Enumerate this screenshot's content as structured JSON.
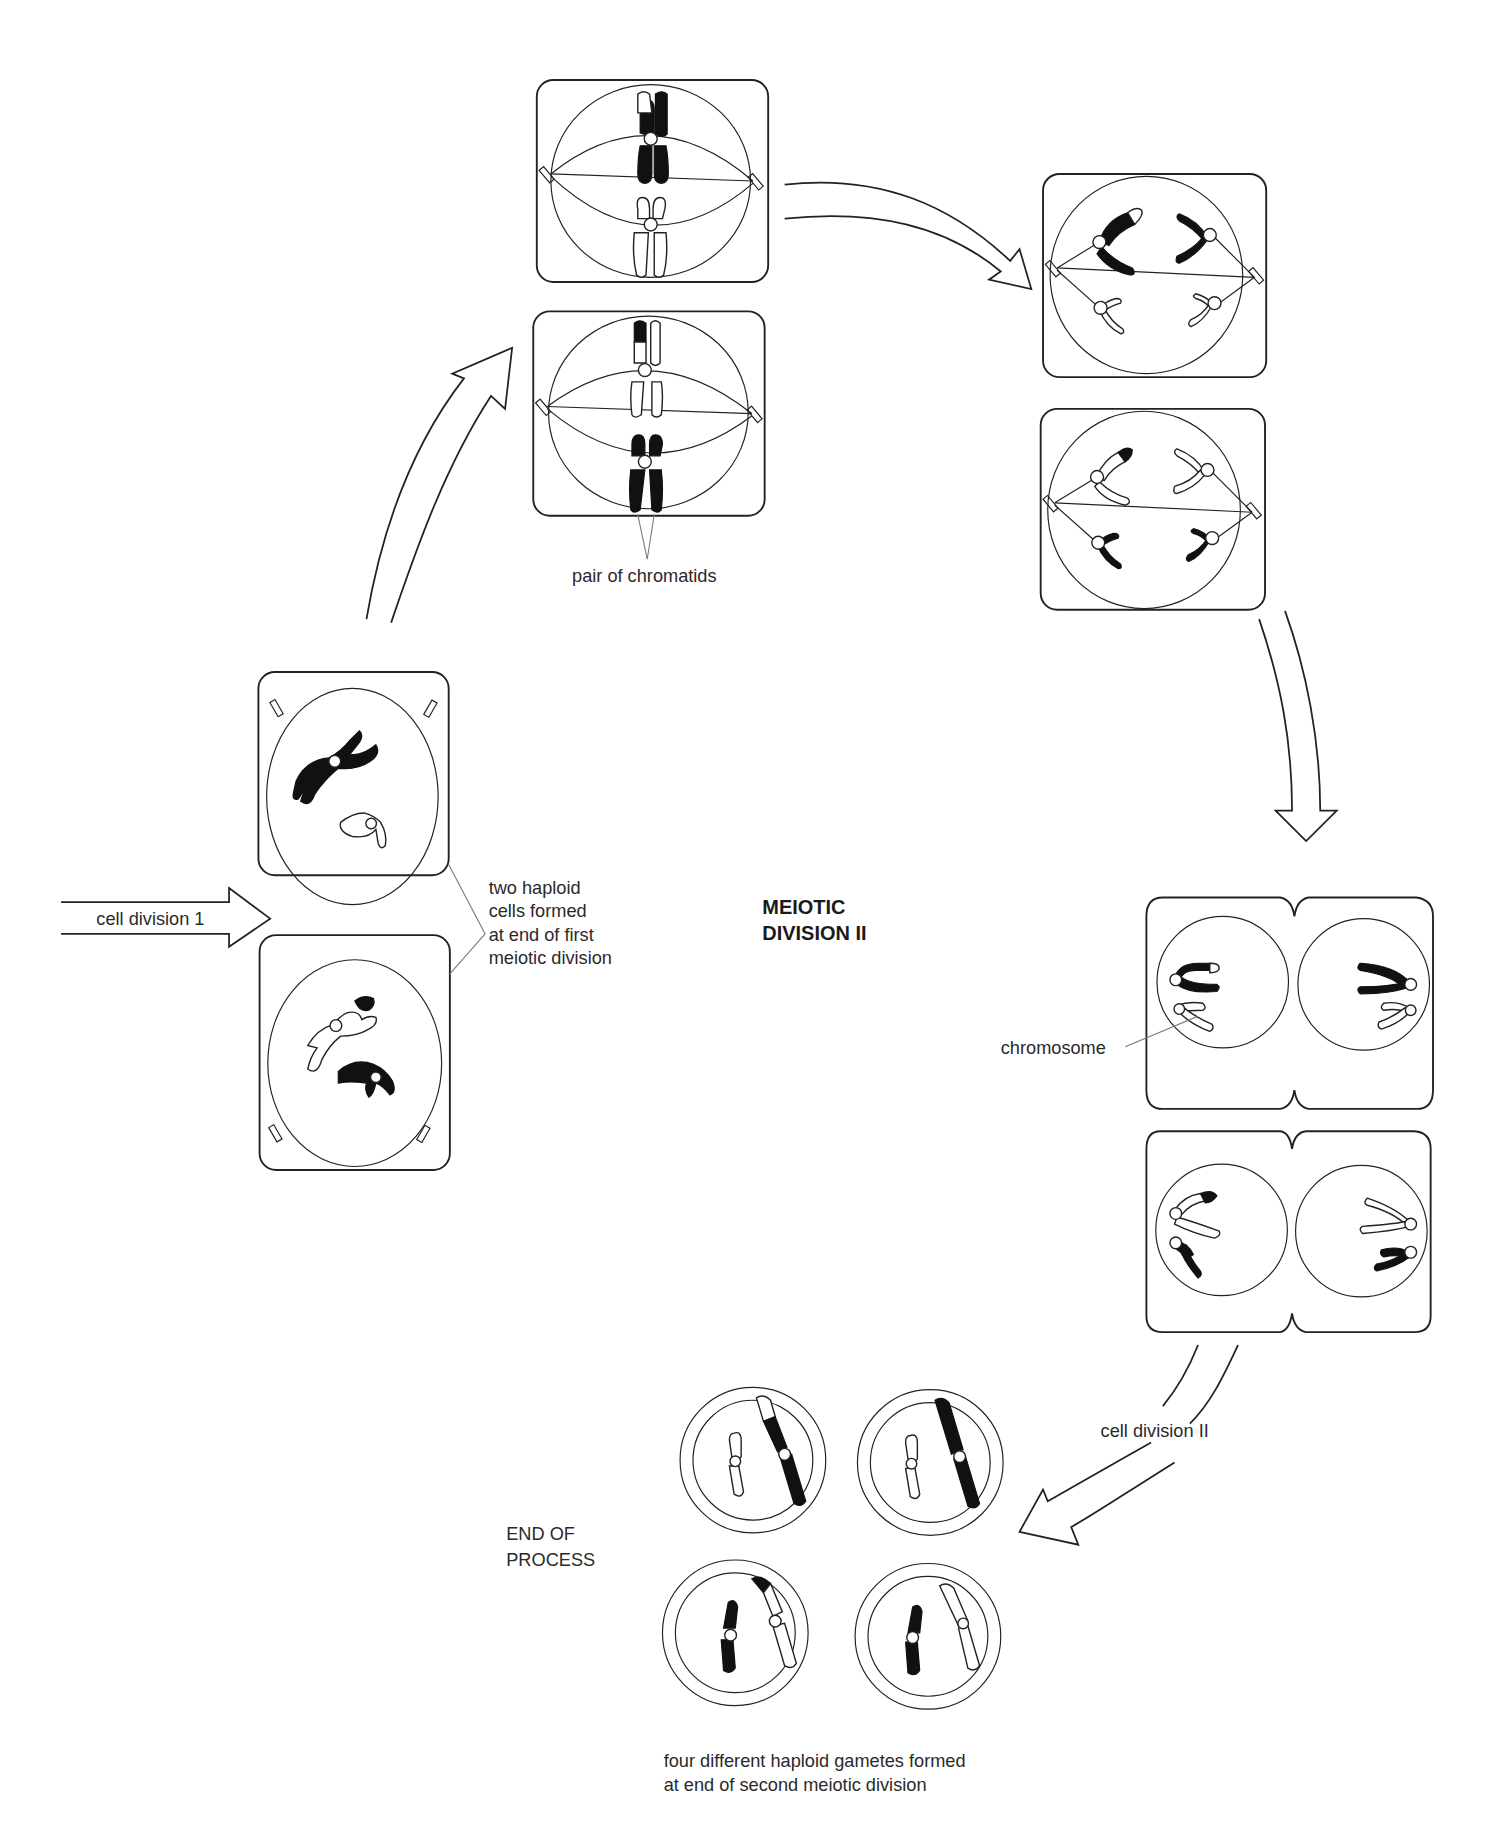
{
  "diagram": {
    "title_line1": "MEIOTIC",
    "title_line2": "DIVISION II",
    "labels": {
      "cell_division_1": "cell division 1",
      "haploid_cells": [
        "two haploid",
        "cells formed",
        "at end of first",
        "meiotic division"
      ],
      "pair_of_chromatids": "pair of chromatids",
      "chromosome": "chromosome",
      "cell_division_2": "cell division II",
      "end_of_process": [
        "END OF",
        "PROCESS"
      ],
      "gametes": [
        "four different haploid gametes formed",
        "at end of second meiotic division"
      ]
    },
    "stages": [
      {
        "name": "haploid-cells-end-of-meiosis-I",
        "cells": 2
      },
      {
        "name": "metaphase-II",
        "cells": 2
      },
      {
        "name": "anaphase-II",
        "cells": 2
      },
      {
        "name": "telophase-II",
        "cells": 2
      },
      {
        "name": "gametes",
        "cells": 4
      }
    ],
    "colors": {
      "line": "#222222",
      "fill_dark": "#111111",
      "background": "#ffffff"
    }
  }
}
